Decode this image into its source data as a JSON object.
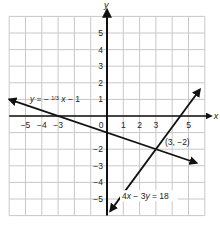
{
  "chart_data": {
    "type": "line",
    "title": "",
    "xlabel": "x",
    "ylabel": "y",
    "xlim": [
      -6,
      6
    ],
    "ylim": [
      -6,
      6
    ],
    "grid": true,
    "x_ticks": [
      "-5",
      "-4",
      "-3",
      "0",
      "1",
      "2",
      "3",
      "5"
    ],
    "y_ticks": [
      "5",
      "4",
      "3",
      "2",
      "1",
      "-2",
      "-3",
      "-4",
      "-5"
    ],
    "series": [
      {
        "name": "y = -1/3 x - 1",
        "label": "y = −",
        "label_frac_num": "1",
        "label_frac_den": "3",
        "label_rest": "x − 1",
        "equation": "y = -(1/3)x - 1",
        "points": [
          [
            -6,
            1
          ],
          [
            5.5,
            -2.83
          ]
        ],
        "arrows": "both"
      },
      {
        "name": "4x - 3y = 18",
        "label": "4x − 3y = 18",
        "equation": "4x - 3y = 18",
        "points": [
          [
            0.2,
            -5.73
          ],
          [
            5.7,
            1.6
          ]
        ],
        "arrows": "both"
      }
    ],
    "annotations": [
      {
        "text": "(3, −2)",
        "x": 3,
        "y": -2
      }
    ]
  },
  "colors": {
    "grid": "#c8c8c8",
    "axis": "#111111",
    "line": "#111111",
    "background": "#ffffff"
  }
}
